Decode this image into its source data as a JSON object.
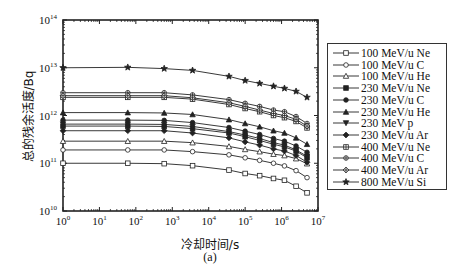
{
  "chart_data": {
    "type": "line",
    "title": "",
    "xlabel": "冷却时间/s",
    "ylabel": "总的残余活度/Bq",
    "sublabel": "(a)",
    "xscale": "log",
    "yscale": "log",
    "xlim": [
      1,
      10000000
    ],
    "ylim": [
      10000000000,
      100000000000000
    ],
    "x_ticks": [
      "10^0",
      "10^1",
      "10^2",
      "10^3",
      "10^4",
      "10^5",
      "10^6",
      "10^7"
    ],
    "y_ticks": [
      "10^10",
      "10^11",
      "10^12",
      "10^13",
      "10^14"
    ],
    "grid": false,
    "legend_position": "right-outside",
    "x": [
      1,
      60,
      600,
      3600,
      36000,
      100000,
      250000,
      600000,
      1200000,
      2500000,
      5000000
    ],
    "series": [
      {
        "name": "100 MeV/u Ne",
        "marker": "square-open",
        "values": [
          100000000000.0,
          100000000000.0,
          98000000000.0,
          89000000000.0,
          72000000000.0,
          61000000000.0,
          55000000000.0,
          48000000000.0,
          44000000000.0,
          33000000000.0,
          24000000000.0
        ]
      },
      {
        "name": "100 MeV/u C",
        "marker": "circle-open",
        "values": [
          190000000000.0,
          190000000000.0,
          190000000000.0,
          175000000000.0,
          150000000000.0,
          130000000000.0,
          115000000000.0,
          100000000000.0,
          88000000000.0,
          70000000000.0,
          50000000000.0
        ]
      },
      {
        "name": "100 MeV/u He",
        "marker": "triangle-open",
        "values": [
          290000000000.0,
          290000000000.0,
          290000000000.0,
          270000000000.0,
          225000000000.0,
          195000000000.0,
          175000000000.0,
          155000000000.0,
          145000000000.0,
          125000000000.0,
          98000000000.0
        ]
      },
      {
        "name": "230 MeV/u Ne",
        "marker": "square-filled",
        "values": [
          600000000000.0,
          600000000000.0,
          590000000000.0,
          530000000000.0,
          430000000000.0,
          360000000000.0,
          300000000000.0,
          250000000000.0,
          220000000000.0,
          180000000000.0,
          130000000000.0
        ]
      },
      {
        "name": "230 MeV/u C",
        "marker": "circle-filled",
        "values": [
          800000000000.0,
          800000000000.0,
          790000000000.0,
          710000000000.0,
          560000000000.0,
          470000000000.0,
          400000000000.0,
          330000000000.0,
          290000000000.0,
          230000000000.0,
          170000000000.0
        ]
      },
      {
        "name": "230 MeV/u He",
        "marker": "triangle-filled",
        "values": [
          1150000000000.0,
          1150000000000.0,
          1130000000000.0,
          1050000000000.0,
          820000000000.0,
          680000000000.0,
          580000000000.0,
          480000000000.0,
          430000000000.0,
          340000000000.0,
          250000000000.0
        ]
      },
      {
        "name": "230 MeV p",
        "marker": "triangle-down-filled",
        "values": [
          660000000000.0,
          660000000000.0,
          650000000000.0,
          590000000000.0,
          460000000000.0,
          390000000000.0,
          330000000000.0,
          270000000000.0,
          240000000000.0,
          190000000000.0,
          140000000000.0
        ]
      },
      {
        "name": "230 MeV/u Ar",
        "marker": "diamond-filled",
        "values": [
          480000000000.0,
          480000000000.0,
          480000000000.0,
          430000000000.0,
          340000000000.0,
          280000000000.0,
          240000000000.0,
          200000000000.0,
          180000000000.0,
          145000000000.0,
          105000000000.0
        ]
      },
      {
        "name": "400 MeV/u Ne",
        "marker": "square-plus",
        "values": [
          2400000000000.0,
          2400000000000.0,
          2400000000000.0,
          2200000000000.0,
          1700000000000.0,
          1400000000000.0,
          1200000000000.0,
          1000000000000.0,
          900000000000.0,
          750000000000.0,
          550000000000.0
        ]
      },
      {
        "name": "400 MeV/u C",
        "marker": "circle-plus",
        "values": [
          3000000000000.0,
          3000000000000.0,
          3000000000000.0,
          2700000000000.0,
          2150000000000.0,
          1800000000000.0,
          1550000000000.0,
          1300000000000.0,
          1200000000000.0,
          950000000000.0,
          680000000000.0
        ]
      },
      {
        "name": "400 MeV/u Ar",
        "marker": "diamond-plus",
        "values": [
          2600000000000.0,
          2600000000000.0,
          2600000000000.0,
          2350000000000.0,
          1850000000000.0,
          1550000000000.0,
          1300000000000.0,
          1100000000000.0,
          1000000000000.0,
          830000000000.0,
          600000000000.0
        ]
      },
      {
        "name": "800 MeV/u Si",
        "marker": "star-filled",
        "values": [
          10000000000000.0,
          10200000000000.0,
          9600000000000.0,
          8800000000000.0,
          6600000000000.0,
          5400000000000.0,
          4700000000000.0,
          4100000000000.0,
          3700000000000.0,
          3200000000000.0,
          2400000000000.0
        ]
      }
    ]
  },
  "layout": {
    "plot": {
      "left": 63,
      "top": 20,
      "right": 318,
      "bottom": 211
    },
    "line_color": "#222222"
  }
}
